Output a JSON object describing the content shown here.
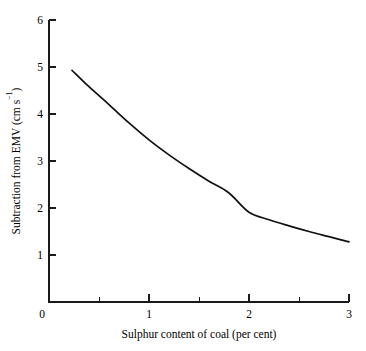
{
  "chart_data": {
    "type": "line",
    "title": "",
    "xlabel": "Sulphur content of coal (per cent)",
    "ylabel": "Subtraction from EMV (cm s⁻¹)",
    "ylabel_main": "Subtraction from EMV (cm s",
    "ylabel_exponent": "−1",
    "ylabel_tail": ")",
    "xlim": [
      0,
      3
    ],
    "ylim": [
      0,
      6
    ],
    "grid": false,
    "legend": null,
    "x_ticks": [
      0,
      1,
      2,
      3
    ],
    "x_tick_labels": [
      "0",
      "1",
      "2",
      "3"
    ],
    "x_minor_ticks": [
      0.5,
      1.5,
      2.5
    ],
    "y_ticks": [
      1,
      2,
      3,
      4,
      5,
      6
    ],
    "y_tick_labels": [
      "1",
      "2",
      "3",
      "4",
      "5",
      "6"
    ],
    "series": [
      {
        "name": "Subtraction from EMV",
        "color": "#111111",
        "x": [
          0.23,
          0.4,
          0.6,
          0.8,
          1.0,
          1.2,
          1.4,
          1.6,
          1.8,
          2.0,
          2.2,
          2.4,
          2.6,
          2.8,
          3.0
        ],
        "values": [
          4.93,
          4.58,
          4.2,
          3.81,
          3.45,
          3.13,
          2.84,
          2.57,
          2.32,
          1.91,
          1.75,
          1.62,
          1.5,
          1.39,
          1.28
        ]
      }
    ]
  },
  "figure": {
    "background_color": "#ffffff",
    "axis_color": "#1a1a1a",
    "curve_color": "#111111"
  }
}
